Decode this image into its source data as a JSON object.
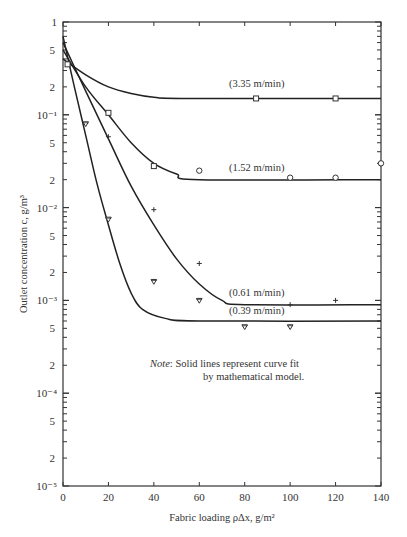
{
  "chart_data": {
    "type": "scatter",
    "title": "",
    "xlabel": "Fabric loading ρΔx, g/m²",
    "ylabel": "Outlet concentration c, g/m³",
    "xlim": [
      0,
      140
    ],
    "ylim": [
      1e-05,
      1
    ],
    "yscale": "log",
    "x_ticks": [
      0,
      20,
      40,
      60,
      80,
      100,
      120,
      140
    ],
    "y_tick_labels": [
      "1",
      "5",
      "2",
      "10⁻¹",
      "5",
      "2",
      "10⁻²",
      "5",
      "2",
      "10⁻³",
      "5",
      "2",
      "10⁻⁴",
      "5",
      "2",
      "10⁻⁵"
    ],
    "grid": false,
    "series": [
      {
        "name": "3.35 m/min",
        "label": "(3.35 m/min)",
        "marker": "square",
        "points": [
          [
            2,
            0.35
          ],
          [
            20,
            0.105
          ],
          [
            40,
            0.028
          ],
          [
            85,
            0.15
          ],
          [
            120,
            0.15
          ]
        ],
        "fit": [
          [
            0,
            0.4
          ],
          [
            10,
            0.27
          ],
          [
            20,
            0.2
          ],
          [
            30,
            0.17
          ],
          [
            40,
            0.155
          ],
          [
            55,
            0.15
          ],
          [
            140,
            0.15
          ]
        ]
      },
      {
        "name": "1.52 m/min",
        "label": "(1.52 m/min)",
        "marker": "circle",
        "points": [
          [
            60,
            0.025
          ],
          [
            100,
            0.021
          ],
          [
            120,
            0.021
          ],
          [
            140,
            0.03
          ]
        ],
        "fit": [
          [
            0,
            0.5
          ],
          [
            10,
            0.2
          ],
          [
            20,
            0.1
          ],
          [
            30,
            0.05
          ],
          [
            40,
            0.03
          ],
          [
            50,
            0.023
          ],
          [
            60,
            0.02
          ],
          [
            140,
            0.02
          ]
        ]
      },
      {
        "name": "0.61 m/min",
        "label": "(0.61 m/min)",
        "marker": "plus",
        "points": [
          [
            20,
            0.058
          ],
          [
            40,
            0.0095
          ],
          [
            60,
            0.0025
          ],
          [
            100,
            0.0009
          ],
          [
            120,
            0.001
          ]
        ],
        "fit": [
          [
            0,
            0.6
          ],
          [
            10,
            0.18
          ],
          [
            20,
            0.055
          ],
          [
            30,
            0.017
          ],
          [
            40,
            0.0065
          ],
          [
            50,
            0.0028
          ],
          [
            60,
            0.0015
          ],
          [
            70,
            0.001
          ],
          [
            80,
            0.0009
          ],
          [
            140,
            0.0009
          ]
        ]
      },
      {
        "name": "0.39 m/min",
        "label": "(0.39 m/min)",
        "marker": "triangle-down",
        "points": [
          [
            10,
            0.08
          ],
          [
            20,
            0.0075
          ],
          [
            40,
            0.0016
          ],
          [
            60,
            0.001
          ],
          [
            80,
            0.00052
          ],
          [
            100,
            0.00052
          ]
        ],
        "fit": [
          [
            0,
            0.7
          ],
          [
            5,
            0.2
          ],
          [
            10,
            0.06
          ],
          [
            15,
            0.018
          ],
          [
            20,
            0.0065
          ],
          [
            25,
            0.0025
          ],
          [
            30,
            0.0012
          ],
          [
            35,
            0.0008
          ],
          [
            45,
            0.00064
          ],
          [
            60,
            0.0006
          ],
          [
            140,
            0.0006
          ]
        ]
      }
    ],
    "annotations": [
      "Note: Solid lines represent curve fit by mathematical model."
    ]
  },
  "labels": {
    "xlabel": "Fabric loading ρΔx, g/m²",
    "ylabel": "Outlet concentration c, g/m³",
    "note_label": "Note",
    "note_line1": ":   Solid lines represent curve fit",
    "note_line2": "by mathematical model.",
    "curve_335": "(3.35 m/min)",
    "curve_152": "(1.52 m/min)",
    "curve_061": "(0.61 m/min)",
    "curve_039": "(0.39 m/min)"
  }
}
